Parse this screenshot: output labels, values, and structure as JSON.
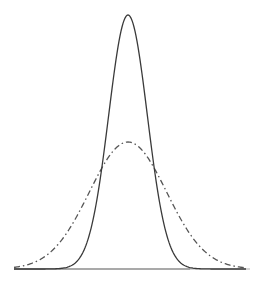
{
  "chart_data": {
    "type": "line",
    "title": "",
    "xlabel": "",
    "ylabel": "",
    "xlim": [
      -6,
      6
    ],
    "grid": false,
    "legend": null,
    "series": [
      {
        "name": "narrow normal (sigma=1)",
        "style": "solid",
        "color": "#3a3a3a",
        "mean": 0,
        "sigma": 1,
        "relative_peak": 1.0
      },
      {
        "name": "wide normal (sigma=2)",
        "style": "dash-dot",
        "color": "#555555",
        "mean": 0,
        "sigma": 2,
        "relative_peak": 0.5
      }
    ],
    "baseline": {
      "color_left": "#555555",
      "color_right": "#b0b0b0"
    }
  },
  "layout": {
    "center_x": 128,
    "baseline_y": 269,
    "peak_y": 15,
    "px_per_unit": 19.3,
    "x_start": 14,
    "x_end": 250
  }
}
